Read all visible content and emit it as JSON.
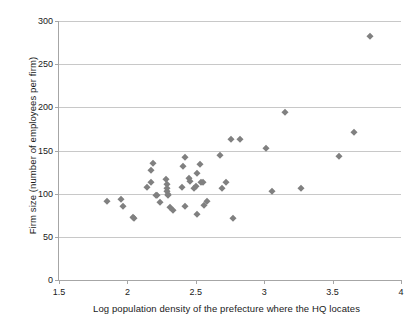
{
  "chart_data": {
    "type": "scatter",
    "title": "",
    "xlabel": "Log population  density of the prefecture where the HQ locates",
    "ylabel": "Firm size (number of employees per firm)",
    "xlim": [
      1.5,
      4
    ],
    "ylim": [
      0,
      300
    ],
    "xticks": [
      1.5,
      2,
      2.5,
      3,
      3.5,
      4
    ],
    "xtick_labels": [
      "1.5",
      "2",
      "2.5",
      "3",
      "3.5",
      "4"
    ],
    "yticks": [
      0,
      50,
      100,
      150,
      200,
      250,
      300
    ],
    "ytick_labels": [
      "0",
      "50",
      "100",
      "150",
      "200",
      "250",
      "300"
    ],
    "grid": "horizontal",
    "legend": "none",
    "marker": {
      "shape": "diamond",
      "color": "#808080",
      "size": 4.6
    },
    "series": [
      {
        "name": "Firms",
        "points": [
          [
            1.85,
            92
          ],
          [
            1.95,
            94
          ],
          [
            1.97,
            86
          ],
          [
            2.04,
            73
          ],
          [
            2.05,
            72
          ],
          [
            2.14,
            108
          ],
          [
            2.17,
            127
          ],
          [
            2.17,
            113
          ],
          [
            2.19,
            136
          ],
          [
            2.21,
            98
          ],
          [
            2.22,
            99
          ],
          [
            2.24,
            90
          ],
          [
            2.28,
            117
          ],
          [
            2.29,
            111
          ],
          [
            2.29,
            106
          ],
          [
            2.29,
            103
          ],
          [
            2.3,
            100
          ],
          [
            2.3,
            99
          ],
          [
            2.31,
            85
          ],
          [
            2.33,
            81
          ],
          [
            2.4,
            108
          ],
          [
            2.41,
            132
          ],
          [
            2.42,
            142
          ],
          [
            2.42,
            86
          ],
          [
            2.45,
            118
          ],
          [
            2.46,
            115
          ],
          [
            2.49,
            106
          ],
          [
            2.5,
            109
          ],
          [
            2.51,
            124
          ],
          [
            2.51,
            77
          ],
          [
            2.53,
            134
          ],
          [
            2.54,
            114
          ],
          [
            2.55,
            113
          ],
          [
            2.56,
            87
          ],
          [
            2.58,
            92
          ],
          [
            2.68,
            145
          ],
          [
            2.69,
            107
          ],
          [
            2.72,
            114
          ],
          [
            2.76,
            163
          ],
          [
            2.77,
            72
          ],
          [
            2.82,
            163
          ],
          [
            3.01,
            153
          ],
          [
            3.06,
            103
          ],
          [
            3.15,
            195
          ],
          [
            3.27,
            107
          ],
          [
            3.55,
            144
          ],
          [
            3.66,
            172
          ],
          [
            3.77,
            283
          ]
        ]
      }
    ]
  }
}
